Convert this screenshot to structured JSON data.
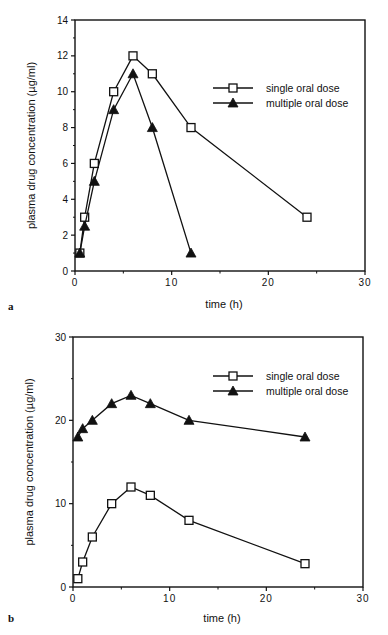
{
  "figure": {
    "caption_partial": "",
    "panels": [
      "a",
      "b"
    ]
  },
  "chart_data": [
    {
      "type": "line",
      "panel": "a",
      "title": "",
      "xlabel": "time (h)",
      "ylabel": "plasma drug concentration (µg/ml)",
      "xlim": [
        0,
        30
      ],
      "ylim": [
        0,
        14
      ],
      "xticks": [
        0,
        10,
        20,
        30
      ],
      "yticks": [
        0,
        2,
        4,
        6,
        8,
        10,
        12,
        14
      ],
      "x_minor_ticks": [
        5,
        15,
        25
      ],
      "y_minor_ticks": [
        1,
        3,
        5,
        7,
        9,
        11,
        13
      ],
      "grid": false,
      "legend_position": "upper right (inside)",
      "series": [
        {
          "name": "single oral dose",
          "marker": "open-square",
          "x": [
            0.5,
            1,
            2,
            4,
            6,
            8,
            12,
            24
          ],
          "y": [
            1,
            3,
            6,
            10,
            12,
            11,
            8,
            3
          ]
        },
        {
          "name": "multiple oral dose",
          "marker": "filled-triangle",
          "x": [
            0.5,
            1,
            2,
            4,
            6,
            8,
            12
          ],
          "y": [
            1,
            2.5,
            5,
            9,
            11,
            8,
            1
          ]
        }
      ]
    },
    {
      "type": "line",
      "panel": "b",
      "title": "",
      "xlabel": "time (h)",
      "ylabel": "plasma drug concentration (µg/ml)",
      "xlim": [
        0,
        30
      ],
      "ylim": [
        0,
        30
      ],
      "xticks": [
        0,
        10,
        20,
        30
      ],
      "yticks": [
        0,
        10,
        20,
        30
      ],
      "x_minor_ticks": [
        5,
        15,
        25
      ],
      "y_minor_ticks": [
        5,
        15,
        25
      ],
      "grid": false,
      "legend_position": "upper right (inside)",
      "series": [
        {
          "name": "single oral dose",
          "marker": "open-square",
          "x": [
            0.5,
            1,
            2,
            4,
            6,
            8,
            12,
            24
          ],
          "y": [
            1,
            3,
            6,
            10,
            12,
            11,
            8,
            2.8
          ]
        },
        {
          "name": "multiple oral dose",
          "marker": "filled-triangle",
          "x": [
            0.5,
            1,
            2,
            4,
            6,
            8,
            12,
            24
          ],
          "y": [
            18,
            19,
            20,
            22,
            23,
            22,
            20,
            18
          ]
        }
      ]
    }
  ],
  "layout": {
    "panels": [
      {
        "x0": 75,
        "x1": 365,
        "y0": 271,
        "y1": 20,
        "legend_x": 213,
        "legend_y": 88,
        "letter_x": 8,
        "letter_y": 310,
        "xlabel_y": 308
      },
      {
        "x0": 73,
        "x1": 363,
        "y0": 587,
        "y1": 337,
        "legend_x": 213,
        "legend_y": 376,
        "letter_x": 8,
        "letter_y": 622,
        "xlabel_y": 622
      }
    ],
    "colors": {
      "line": "#111111",
      "marker_fill_open": "#ffffff",
      "marker_fill_solid": "#111111",
      "background": "#ffffff"
    }
  }
}
